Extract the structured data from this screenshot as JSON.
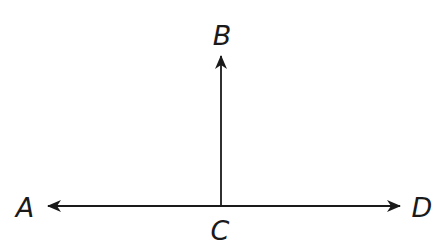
{
  "diagram": {
    "type": "rays",
    "stroke_color": "#1a1a1a",
    "background": "#ffffff",
    "points": {
      "A": {
        "label": "A",
        "x": 25,
        "y": 217
      },
      "B": {
        "label": "B",
        "x": 222,
        "y": 45
      },
      "C": {
        "label": "C",
        "x": 220,
        "y": 240
      },
      "D": {
        "label": "D",
        "x": 422,
        "y": 217
      }
    },
    "rays": [
      {
        "name": "CA",
        "from": "C",
        "to": "A"
      },
      {
        "name": "CB",
        "from": "C",
        "to": "B"
      },
      {
        "name": "CD",
        "from": "C",
        "to": "D"
      }
    ]
  }
}
